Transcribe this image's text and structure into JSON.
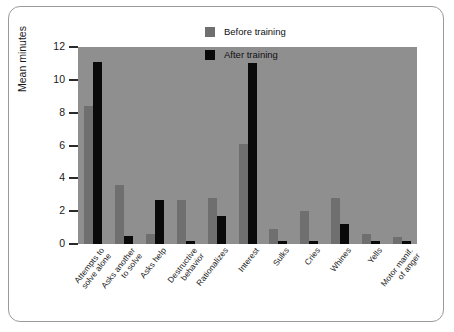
{
  "chart_data": {
    "type": "bar",
    "title": "",
    "xlabel": "",
    "ylabel": "Mean minutes",
    "ylim": [
      0,
      12
    ],
    "yticks": [
      0,
      2,
      4,
      6,
      8,
      10,
      12
    ],
    "grid": false,
    "legend_position": "top-right",
    "categories": [
      "Attempts to\nsolve alone",
      "Asks another\nto solve",
      "Asks help",
      "Destructive\nbehavior",
      "Rationalizes",
      "Interest",
      "Sulks",
      "Cries",
      "Whines",
      "Yells",
      "Motor manif.\nof anger"
    ],
    "series": [
      {
        "name": "Before training",
        "color": "#6f6f6f",
        "values": [
          8.4,
          3.6,
          0.6,
          2.7,
          2.8,
          6.1,
          0.9,
          2.0,
          2.8,
          0.6,
          0.4
        ]
      },
      {
        "name": "After training",
        "color": "#0a0a0a",
        "values": [
          11.1,
          0.5,
          2.7,
          0.2,
          1.7,
          11.0,
          0.2,
          0.2,
          1.2,
          0.2,
          0.2
        ]
      }
    ]
  },
  "legend": {
    "items": [
      {
        "label": "Before training",
        "color": "#6f6f6f"
      },
      {
        "label": "After training",
        "color": "#0a0a0a"
      }
    ]
  },
  "axes": {
    "y_title": "Mean minutes",
    "y_tick_labels": [
      "12",
      "10",
      "8",
      "6",
      "4",
      "2",
      "0"
    ]
  }
}
